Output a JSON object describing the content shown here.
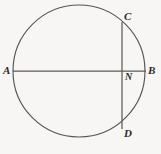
{
  "figure": {
    "type": "geometry-diagram",
    "background_color": "#f7f6f4",
    "stroke_color": "#555555",
    "label_color": "#2b2b2b",
    "circle": {
      "center_x": 79,
      "center_y": 71,
      "radius": 66
    },
    "segments": [
      {
        "name": "AB",
        "x1": 13,
        "y1": 71,
        "x2": 146,
        "y2": 71
      },
      {
        "name": "CD",
        "x1": 122,
        "y1": 22,
        "x2": 122,
        "y2": 129
      }
    ],
    "points": [
      {
        "id": "A",
        "label": "A",
        "x": 13,
        "y": 71
      },
      {
        "id": "B",
        "label": "B",
        "x": 146,
        "y": 71
      },
      {
        "id": "C",
        "label": "C",
        "x": 122,
        "y": 22
      },
      {
        "id": "D",
        "label": "D",
        "x": 122,
        "y": 129
      },
      {
        "id": "N",
        "label": "N",
        "x": 122,
        "y": 71
      }
    ]
  }
}
